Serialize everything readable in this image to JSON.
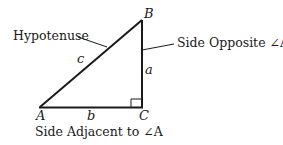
{
  "diagram": {
    "type": "right-triangle",
    "colors": {
      "stroke": "#1a1a1a",
      "background": "#ffffff"
    },
    "vertices": {
      "A": {
        "label": "A",
        "x": 40,
        "y": 107
      },
      "B": {
        "label": "B",
        "x": 142,
        "y": 20
      },
      "C": {
        "label": "C",
        "x": 142,
        "y": 107
      }
    },
    "sides": {
      "a": {
        "label": "a",
        "between": [
          "B",
          "C"
        ]
      },
      "b": {
        "label": "b",
        "between": [
          "A",
          "C"
        ]
      },
      "c": {
        "label": "c",
        "between": [
          "A",
          "B"
        ]
      }
    },
    "right_angle_at": "C",
    "captions": {
      "hypotenuse": "Hypotenuse",
      "opposite": "Side Opposite ∠A",
      "adjacent": "Side Adjacent to ∠A"
    }
  }
}
